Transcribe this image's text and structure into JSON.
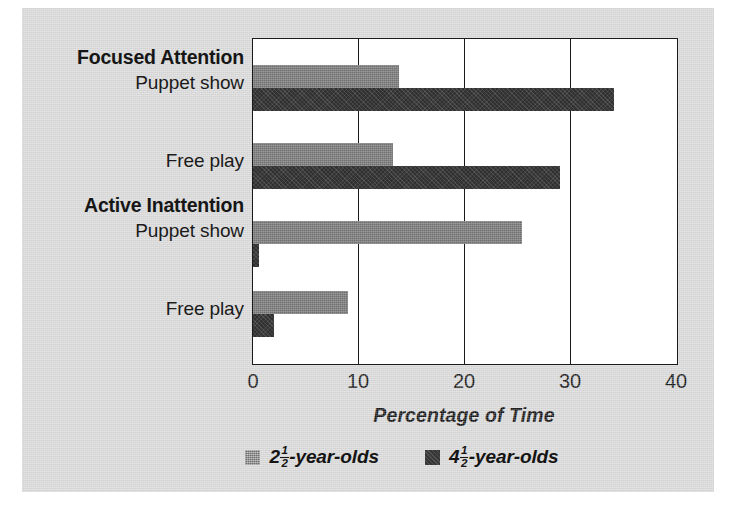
{
  "chart_data": {
    "type": "bar",
    "orientation": "horizontal",
    "title": "",
    "xlabel": "Percentage of Time",
    "ylabel": "",
    "xlim": [
      0,
      40
    ],
    "xticks": [
      0,
      10,
      20,
      30,
      40
    ],
    "xtick_labels": [
      "0",
      "10",
      "20",
      "30",
      "40"
    ],
    "grid": "vertical",
    "legend_position": "bottom-center",
    "groups": [
      {
        "heading": "Focused Attention",
        "categories": [
          {
            "label": "Puppet show",
            "values": [
              13.8,
              34.1
            ]
          },
          {
            "label": "Free play",
            "values": [
              13.2,
              29.0
            ]
          }
        ]
      },
      {
        "heading": "Active Inattention",
        "categories": [
          {
            "label": "Puppet show",
            "values": [
              25.4,
              0.6
            ]
          },
          {
            "label": "Free play",
            "values": [
              9.0,
              2.0
            ]
          }
        ]
      }
    ],
    "series": [
      {
        "name": "2½-year-olds",
        "name_parts": {
          "whole": "2",
          "numerator": "1",
          "denominator": "2",
          "suffix": "-year-olds"
        },
        "color": "#7d7d7d",
        "values": [
          13.8,
          13.2,
          25.4,
          9.0
        ]
      },
      {
        "name": "4½-year-olds",
        "name_parts": {
          "whole": "4",
          "numerator": "1",
          "denominator": "2",
          "suffix": "-year-olds"
        },
        "color": "#3b3b3b",
        "values": [
          34.1,
          29.0,
          0.6,
          2.0
        ]
      }
    ],
    "categories": [
      "Focused Attention / Puppet show",
      "Focused Attention / Free play",
      "Active Inattention / Puppet show",
      "Active Inattention / Free play"
    ]
  },
  "labels": {
    "group1_heading": "Focused Attention",
    "group1_cat1": "Puppet show",
    "group1_cat2": "Free play",
    "group2_heading": "Active Inattention",
    "group2_cat1": "Puppet show",
    "group2_cat2": "Free play"
  },
  "axis": {
    "title": "Percentage of Time",
    "tick0": "0",
    "tick1": "10",
    "tick2": "20",
    "tick3": "30",
    "tick4": "40"
  },
  "legend": {
    "entry1": {
      "whole": "2",
      "numerator": "1",
      "denominator": "2",
      "suffix": "-year-olds",
      "color": "#7d7d7d"
    },
    "entry2": {
      "whole": "4",
      "numerator": "1",
      "denominator": "2",
      "suffix": "-year-olds",
      "color": "#3b3b3b"
    }
  },
  "colors": {
    "panel_background": "#d9d9d9",
    "plot_background": "#ffffff",
    "frame": "#1a1a1a",
    "series_young": "#7d7d7d",
    "series_old": "#3b3b3b"
  }
}
